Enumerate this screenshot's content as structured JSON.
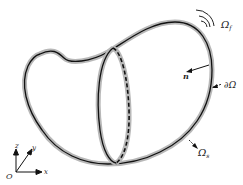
{
  "diagram": {
    "type": "domain-boundary-illustration",
    "labels": {
      "fluid_domain": "Ω",
      "fluid_domain_sub": "f",
      "normal_vector": "n",
      "boundary": "∂Ω",
      "solid_domain": "Ω",
      "solid_domain_sub": "s"
    },
    "axes": {
      "origin": "O",
      "x": "x",
      "y": "y",
      "z": "z"
    },
    "colors": {
      "stroke": "#111111",
      "halo": "#b0b0b0",
      "text": "#222222"
    }
  }
}
